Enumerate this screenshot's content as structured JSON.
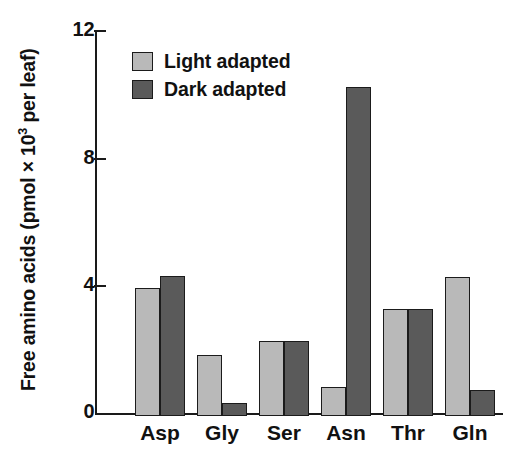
{
  "chart_data": {
    "type": "bar",
    "title": "",
    "xlabel": "",
    "ylabel": "Free amino acids (pmol × 10³ per leaf)",
    "ylabel_parts": {
      "before": "Free amino acids (pmol × 10",
      "exponent": "3",
      "after": " per leaf)"
    },
    "categories": [
      "Asp",
      "Gly",
      "Ser",
      "Asn",
      "Thr",
      "Gln"
    ],
    "series": [
      {
        "name": "Light adapted",
        "color": "#b9b9b9",
        "values": [
          4.0,
          1.9,
          2.35,
          0.9,
          3.35,
          4.35
        ]
      },
      {
        "name": "Dark adapted",
        "color": "#5a5a5a",
        "values": [
          4.4,
          0.4,
          2.35,
          10.3,
          3.35,
          0.8
        ]
      }
    ],
    "ylim": [
      0,
      12
    ],
    "yticks": [
      0,
      4,
      8,
      12
    ],
    "ytick_labels": [
      "0",
      "4",
      "8",
      "12"
    ],
    "grid": false,
    "legend_position": "top-left-inside",
    "axis_color": "#1a1a1a",
    "bar_edge_color": "#1b1b1b",
    "background": "#ffffff"
  },
  "legend": {
    "items": [
      {
        "label": "Light adapted",
        "swatch": "light"
      },
      {
        "label": "Dark adapted",
        "swatch": "dark"
      }
    ]
  }
}
